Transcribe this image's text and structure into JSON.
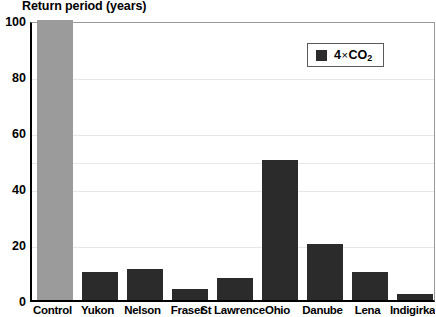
{
  "chart_data": {
    "type": "bar",
    "title": "Return period (years)",
    "xlabel": "",
    "ylabel": "Return period (years)",
    "ylim": [
      0,
      100
    ],
    "yticks": [
      0,
      20,
      40,
      60,
      80,
      100
    ],
    "grid": true,
    "legend": {
      "position": "top-right",
      "entries": [
        {
          "name": "4×CO2",
          "label_main": "4",
          "label_times": "×",
          "label_species": "CO",
          "label_sub": "2",
          "color": "#2b2b2b"
        }
      ]
    },
    "categories": [
      "Control",
      "Yukon",
      "Nelson",
      "Fraser",
      "St Lawrence",
      "Ohio",
      "Danube",
      "Lena",
      "Indigirka"
    ],
    "values": [
      100,
      10,
      11,
      4,
      8,
      50,
      20,
      10,
      2
    ],
    "bar_colors": [
      "#9b9b9b",
      "#2b2b2b",
      "#2b2b2b",
      "#2b2b2b",
      "#2b2b2b",
      "#2b2b2b",
      "#2b2b2b",
      "#2b2b2b",
      "#2b2b2b"
    ]
  }
}
